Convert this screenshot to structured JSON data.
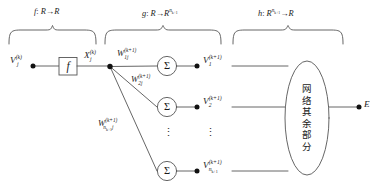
{
  "diagram": {
    "stroke_color": "#555555",
    "text_color": "#1a1a1a",
    "braces": [
      {
        "id": "brace-f",
        "label_plain": "f: R→R",
        "label_fn": "f",
        "label_colon": ":",
        "label_body": "R→R"
      },
      {
        "id": "brace-g",
        "label_plain": "g: R→R^{n_{k+1}}",
        "label_fn": "g",
        "label_colon": ":",
        "label_body": "R→R",
        "sup_base": "n",
        "sup_sub": "k+1"
      },
      {
        "id": "brace-h",
        "label_plain": "h: R^{n_{k+1}}→R",
        "label_fn": "h",
        "label_colon": ":",
        "label_body_pre": "R",
        "sup_base": "n",
        "sup_sub": "k+1",
        "label_body_post": "→R"
      }
    ],
    "nodes": {
      "input": {
        "base": "V",
        "sub": "j",
        "sup": "(k)"
      },
      "activation_box": {
        "label": "f"
      },
      "activation_output": {
        "base": "X",
        "sub": "j",
        "sup": "(k)"
      },
      "sum_symbol": "Σ",
      "outputs": [
        {
          "base": "V",
          "sub": "1",
          "sup": "(k+1)"
        },
        {
          "base": "V",
          "sub": "2",
          "sup": "(k+1)"
        },
        {
          "base": "V",
          "sub_base": "n",
          "sub_sub": "k+1",
          "sup": "(k+1)"
        }
      ],
      "error": {
        "label": "E"
      }
    },
    "weights": [
      {
        "base": "W",
        "sub": "1j",
        "sup": "(k+1)"
      },
      {
        "base": "W",
        "sub": "2j",
        "sup": "(k+1)"
      },
      {
        "base": "W",
        "sub_base": "n",
        "sub_sub": "k+1",
        "sub_tail": "j",
        "sup": "(k+1)"
      }
    ],
    "ellipse": {
      "name": "rest-of-network",
      "text": "网络其余部分",
      "chars": [
        "网",
        "络",
        "其",
        "余",
        "部",
        "分"
      ]
    },
    "vertical_dots": "⋮"
  }
}
